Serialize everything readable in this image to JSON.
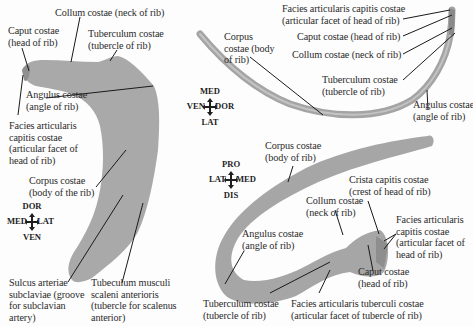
{
  "figure": {
    "rib_color": "#a8a8a8",
    "rib_shadow": "#8e8e8e",
    "line_color": "#1a1a1a",
    "panels": [
      {
        "id": "first-rib",
        "labels": {
          "collum": "Collum costae (neck of rib)",
          "caput": "Caput costae\n(head of rib)",
          "tuberculum": "Tuberculum costae\n(tubercle of rib)",
          "angulus": "Angulus costae\n(angle of rib)",
          "facies": "Facies articularis\ncapitis costae\n(articular facet of\nhead of rib)",
          "corpus": "Corpus costae\n(body of the rib)",
          "sulcus": "Sulcus arteriae\nsubclaviae (groove\nfor subclavian\nartery)",
          "tuberculum_scaleni": "Tubeculum musculi\nscaleni anterioris\n(tubercle for scalenus\nanterior)"
        },
        "compass": {
          "top": "DOR",
          "left": "MED",
          "right": "LAT",
          "bottom": "VEN"
        }
      },
      {
        "id": "rib-lateral-view",
        "labels": {
          "facies": "Facies articularis capitis costae\n(articular facet of head of rib)",
          "caput": "Caput costae (head of rib)",
          "collum": "Collum costae (neck of rib)",
          "corpus": "Corpus\ncostae (body\nof rib)",
          "tuberculum": "Tuberculum costae\n(tubercle of rib)",
          "angulus": "Angulus costae\n(angle of rib)"
        },
        "compass": {
          "top": "MED",
          "left": "VEN",
          "right": "DOR",
          "bottom": "LAT"
        }
      },
      {
        "id": "rib-posterior-view",
        "labels": {
          "corpus": "Corpus costae\n(body of rib)",
          "crista": "Crista capitis costae\n(crest of head of rib)",
          "collum": "Collum costae\n(neck of rib)",
          "facies": "Facies articularis\ncapitis costae\n(articular facet of\nhead of rib)",
          "angulus": "Angulus costae\n(angle of rib)",
          "caput": "Caput costae\n(head of rib)",
          "tuberculum": "Tuberculum costae\n(tubercle of rib)",
          "facies_tuberculi": "Facies articularis tuberculi costae\n(articular facet of tubercle of rib)"
        },
        "compass": {
          "top": "PRO",
          "left": "LAT",
          "right": "MED",
          "bottom": "DIS"
        }
      }
    ]
  }
}
